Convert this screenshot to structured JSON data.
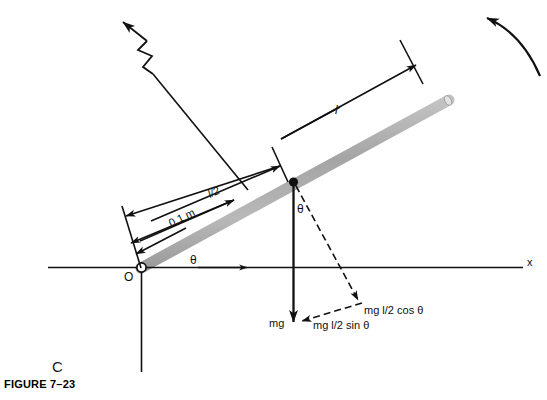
{
  "figure": {
    "caption": "FIGURE 7–23",
    "panel_letter": "C",
    "background_color": "#ffffff",
    "rod_color": "#b8b8b8",
    "line_color": "#111111"
  },
  "axes": {
    "x_label": "x",
    "origin_label": "O"
  },
  "angles": {
    "theta_at_base": "θ",
    "theta_at_center": "θ"
  },
  "dimensions": {
    "full_length": "l",
    "half_length": "l/2",
    "offset_distance": "0.1 m"
  },
  "forces": {
    "weight": "mg",
    "torque_cos": "mg l/2 cos θ",
    "torque_sin": "mg l/2 sin θ"
  },
  "annotations": {
    "rotation_arrow": "curved-rotation-arrow",
    "break_symbol": "broken-line-zigzag"
  }
}
